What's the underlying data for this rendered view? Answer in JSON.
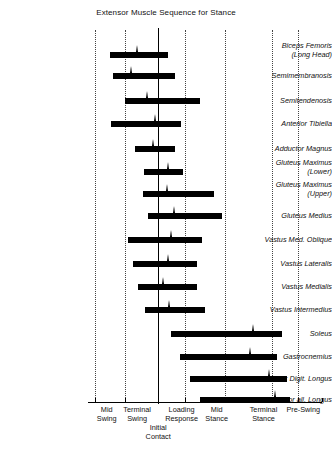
{
  "chart": {
    "title": "Extensor Muscle Sequence for Stance",
    "type": "gantt",
    "note": "Horizontal bars show EMG activity period of each muscle across the gait cycle phases."
  },
  "x_axis": {
    "phase_labels": [
      {
        "id": "mid-swing",
        "line1": "Mid",
        "line2": "Swing",
        "center_pct": 8.0
      },
      {
        "id": "terminal-swing",
        "line1": "Terminal",
        "line2": "Swing",
        "center_pct": 21.0
      },
      {
        "id": "initial-contact",
        "line1": "Initial",
        "line2": "Contact",
        "center_pct": 30.0
      },
      {
        "id": "loading-response",
        "line1": "Loading",
        "line2": "Response",
        "center_pct": 40.0
      },
      {
        "id": "mid-stance",
        "line1": "Mid",
        "line2": "Stance",
        "center_pct": 55.0
      },
      {
        "id": "terminal-stance",
        "line1": "Terminal",
        "line2": "Stance",
        "center_pct": 75.0
      },
      {
        "id": "pre-swing",
        "line1": "Pre-Swing",
        "line2": "",
        "center_pct": 92.0
      }
    ],
    "gridlines_pct": [
      3.0,
      15.8,
      41.5,
      58.5,
      78.6,
      89.7
    ],
    "contact_line_pct": 29.9,
    "ticks_pct": [
      3.0,
      15.8,
      29.9,
      41.5,
      58.5,
      78.6,
      89.7,
      100.0
    ]
  },
  "chart_data": {
    "type": "bar",
    "title": "Extensor Muscle Sequence for Stance",
    "xlabel": "",
    "ylabel": "",
    "categories": [
      "Biceps Femoris (Long Head)",
      "Semimembranosis",
      "Semitendenosis",
      "Anterior Tibiella",
      "Adductor Magnus",
      "Gluteus Maximus (Lower)",
      "Gluteus Maximus (Upper)",
      "Gluteus Medius",
      "Vastus Med. Oblique",
      "Vastus Lateralis",
      "Vastus Medialis",
      "Vastus Intermedius",
      "Soleus",
      "Gastrocnemius",
      "Flexor Digit. Longus",
      "Flexor all. Longus"
    ],
    "bars": [
      {
        "label": "Biceps Femoris",
        "label2": "(Long Head)",
        "y": 55,
        "start_pct": 9.4,
        "end_pct": 34.2,
        "peak_pct": 21.4
      },
      {
        "label": "Semimembranosis",
        "label2": "",
        "y": 76,
        "start_pct": 10.7,
        "end_pct": 37.2,
        "peak_pct": 18.8
      },
      {
        "label": "Semitendenosis",
        "label2": "",
        "y": 101,
        "start_pct": 15.8,
        "end_pct": 47.9,
        "peak_pct": 25.6
      },
      {
        "label": "Anterior Tibiella",
        "label2": "",
        "y": 124,
        "start_pct": 9.8,
        "end_pct": 39.7,
        "peak_pct": 29.1
      },
      {
        "label": "Adductor Magnus",
        "label2": "",
        "y": 149,
        "start_pct": 20.1,
        "end_pct": 37.2,
        "peak_pct": 28.2
      },
      {
        "label": "Gluteus Maximus",
        "label2": "(Lower)",
        "y": 172,
        "start_pct": 23.9,
        "end_pct": 40.6,
        "peak_pct": 34.6
      },
      {
        "label": "Gluteus Maximus",
        "label2": "(Upper)",
        "y": 194,
        "start_pct": 23.5,
        "end_pct": 53.8,
        "peak_pct": 34.2
      },
      {
        "label": "Gluteus Medius",
        "label2": "",
        "y": 216,
        "start_pct": 25.6,
        "end_pct": 57.3,
        "peak_pct": 37.2
      },
      {
        "label": "Vastus Med. Oblique",
        "label2": "",
        "y": 240,
        "start_pct": 17.1,
        "end_pct": 48.7,
        "peak_pct": 35.9
      },
      {
        "label": "Vastus Lateralis",
        "label2": "",
        "y": 264,
        "start_pct": 19.2,
        "end_pct": 46.6,
        "peak_pct": 34.6
      },
      {
        "label": "Vastus Medialis",
        "label2": "",
        "y": 287,
        "start_pct": 21.4,
        "end_pct": 46.6,
        "peak_pct": 32.1
      },
      {
        "label": "Vastus Intermedius",
        "label2": "",
        "y": 310,
        "start_pct": 24.4,
        "end_pct": 50.0,
        "peak_pct": 35.0
      },
      {
        "label": "Soleus",
        "label2": "",
        "y": 334,
        "start_pct": 35.5,
        "end_pct": 82.9,
        "peak_pct": 70.9
      },
      {
        "label": "Gastrocnemius",
        "label2": "",
        "y": 357,
        "start_pct": 39.3,
        "end_pct": 80.8,
        "peak_pct": 69.7
      },
      {
        "label": "Flexor Digit. Longus",
        "label2": "",
        "y": 379,
        "start_pct": 43.6,
        "end_pct": 85.0,
        "peak_pct": 77.4
      },
      {
        "label": "Flexor all. Longus",
        "label2": "",
        "y": 400,
        "start_pct": 47.9,
        "end_pct": 86.3,
        "peak_pct": 80.3
      }
    ]
  }
}
